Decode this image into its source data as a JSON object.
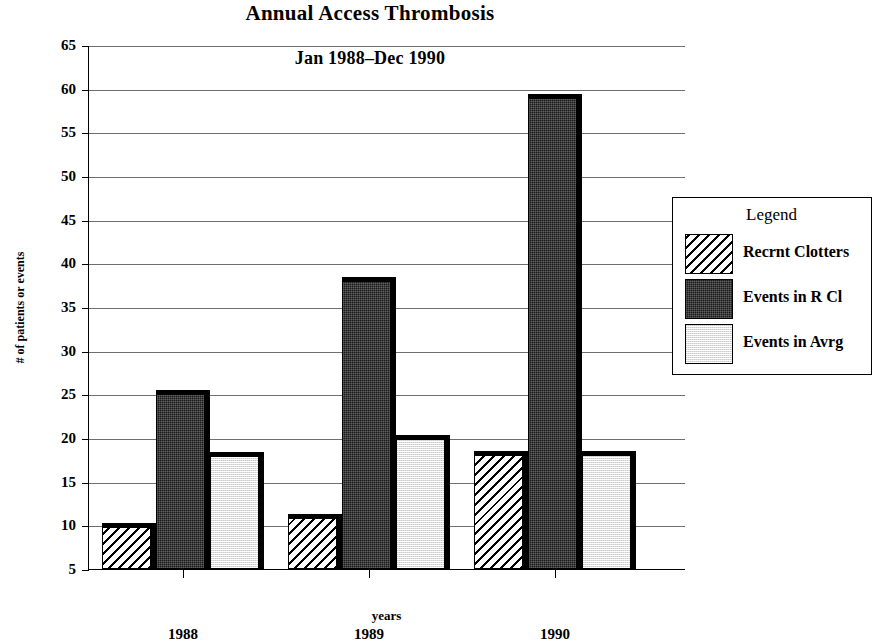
{
  "chart_data": {
    "type": "bar",
    "title": "Annual Access Thrombosis",
    "subtitle": "Jan 1988–Dec 1990",
    "xlabel": "years",
    "ylabel": "# of patients or events",
    "categories": [
      "1988",
      "1989",
      "1990"
    ],
    "series": [
      {
        "name": "Recrnt Clotters",
        "values": [
          10.3,
          11.3,
          18.5
        ],
        "fill": "hatch"
      },
      {
        "name": "Events in R Cl",
        "values": [
          25.5,
          38.4,
          59.4
        ],
        "fill": "dark"
      },
      {
        "name": "Events in Avrg",
        "values": [
          18.4,
          20.4,
          18.5
        ],
        "fill": "light"
      }
    ],
    "ylim": [
      5,
      65
    ],
    "ytick_values": [
      65,
      60,
      55,
      50,
      45,
      40,
      35,
      30,
      25,
      20,
      15,
      10,
      5
    ],
    "ytick_labels": [
      "65",
      "60",
      "55",
      "50",
      "45",
      "40",
      "35",
      "30",
      "25",
      "20",
      "15",
      "10",
      "5"
    ],
    "grid": true,
    "legend_position": "right",
    "legend_title": "Legend",
    "colors": {
      "hatch": "#ffffff",
      "dark": "#1a1a1a",
      "light": "#e3e3e3",
      "axis": "#000000",
      "gridline": "#6f6f6f"
    }
  }
}
